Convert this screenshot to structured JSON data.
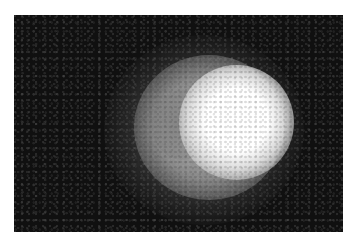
{
  "image": {
    "description": "Grayscale image of a diffuse glowing sphere on a dark noisy background",
    "colors": {
      "background": "#101010",
      "border": "#ffffff",
      "core": "#ffffff",
      "halo": "#9a9a9a"
    }
  }
}
